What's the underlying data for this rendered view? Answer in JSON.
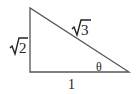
{
  "diagram": {
    "type": "right-triangle",
    "stroke_color": "#555555",
    "text_color": "#222222",
    "vertices": {
      "top": [
        30,
        8
      ],
      "right_angle": [
        30,
        72
      ],
      "acute": [
        129,
        72
      ]
    },
    "labels": {
      "vertical_leg": "√2",
      "vertical_leg_radicand": "2",
      "hypotenuse": "√3",
      "hypotenuse_radicand": "3",
      "base": "1",
      "angle": "θ"
    }
  }
}
